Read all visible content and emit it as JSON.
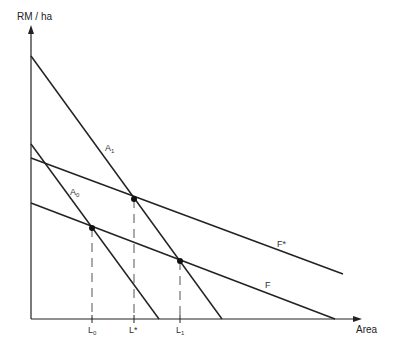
{
  "diagram": {
    "y_axis_label": "RM / ha",
    "x_axis_label": "Area",
    "curves": [
      {
        "id": "A1",
        "label": "A",
        "sub": "1",
        "from": [
          31,
          56
        ],
        "to": [
          222,
          319
        ]
      },
      {
        "id": "A0",
        "label": "A",
        "sub": "0",
        "from": [
          31,
          144
        ],
        "to": [
          159,
          319
        ]
      },
      {
        "id": "Fstar",
        "label": "F*",
        "from": [
          31,
          158
        ],
        "to": [
          343,
          274
        ]
      },
      {
        "id": "F",
        "label": "F",
        "from": [
          31,
          203
        ],
        "to": [
          335,
          319
        ]
      }
    ],
    "points": [
      {
        "id": "L0-eq",
        "x": 92,
        "y": 228
      },
      {
        "id": "Lstar-eq",
        "x": 134,
        "y": 199
      },
      {
        "id": "L1-eq",
        "x": 180,
        "y": 261
      }
    ],
    "x_ticks": [
      {
        "label": "L",
        "sub": "0",
        "x": 92
      },
      {
        "label": "L*",
        "sub": "",
        "x": 134
      },
      {
        "label": "L",
        "sub": "1",
        "x": 180
      }
    ],
    "colors": {
      "line": "#222222",
      "dash": "#555555",
      "text": "#333333"
    }
  }
}
